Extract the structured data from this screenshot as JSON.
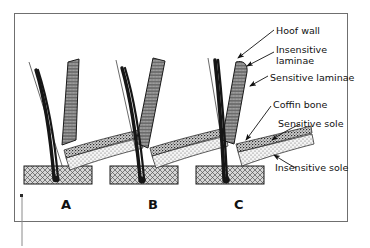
{
  "figure": {
    "type": "anatomical-diagram",
    "frame_color": "#6f6f6f",
    "background_color": "#ffffff",
    "ink_color": "#111111"
  },
  "panels": [
    {
      "id": "A",
      "label": "A",
      "caption_x": 61,
      "caption_y": 197,
      "rotation_stage": "normal alignment"
    },
    {
      "id": "B",
      "label": "B",
      "caption_x": 148,
      "caption_y": 197,
      "rotation_stage": "moderate rotation"
    },
    {
      "id": "C",
      "label": "C",
      "caption_x": 234,
      "caption_y": 197,
      "rotation_stage": "severe rotation"
    }
  ],
  "callouts": [
    {
      "key": "hoof_wall",
      "text": "Hoof wall",
      "x": 276,
      "y": 26
    },
    {
      "key": "insensitive_laminae",
      "text": "Insensitive\nlaminae",
      "x": 276,
      "y": 45
    },
    {
      "key": "sensitive_laminae",
      "text": "Sensitive laminae",
      "x": 270,
      "y": 73
    },
    {
      "key": "coffin_bone",
      "text": "Coffin bone",
      "x": 273,
      "y": 100
    },
    {
      "key": "sensitive_sole",
      "text": "Sensitive sole",
      "x": 278,
      "y": 119
    },
    {
      "key": "insensitive_sole",
      "text": "Insensitive sole",
      "x": 275,
      "y": 163
    }
  ],
  "legend_structures": [
    "Hoof wall",
    "Insensitive laminae",
    "Sensitive laminae",
    "Coffin bone",
    "Sensitive sole",
    "Insensitive sole"
  ],
  "colors": {
    "hoof_wall_fill": "#2b2b2b",
    "laminae_fill": "#8f8f8f",
    "coffin_bone_fill": "#9a9a9a",
    "sensitive_sole_fill": "#b8b8b8",
    "insensitive_sole_fill": "#efefef",
    "ground_block_fill": "#c9c9c9",
    "outline": "#1a1a1a",
    "frame": "#6f6f6f"
  }
}
